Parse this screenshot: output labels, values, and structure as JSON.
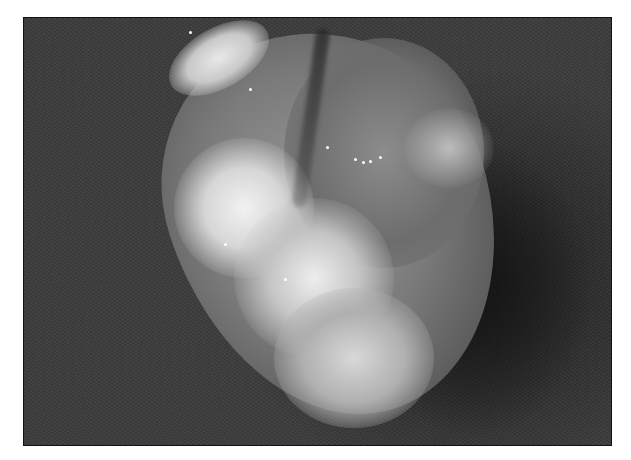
{
  "image": {
    "type": "grayscale photograph",
    "subject": "tissue specimen on dark textured background",
    "frame": {
      "left": 23,
      "top": 17,
      "width": 589,
      "height": 429
    },
    "colors": {
      "background": "#3d3d3d",
      "shadow": "#1e1e1e",
      "specimen_highlight": "#eeeeee",
      "specimen_mid": "#7a7a7a",
      "border": "#111111",
      "page": "#ffffff"
    }
  }
}
